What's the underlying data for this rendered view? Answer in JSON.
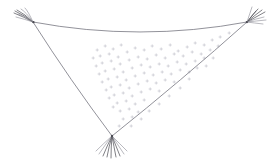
{
  "image": {
    "title": "Triangular net sketch",
    "subject": "triangular-net",
    "background_color": "#ffffff",
    "width": 278,
    "height": 164
  },
  "palette": {
    "line": "#6e6e78",
    "tassel_dark": "#4a4a52",
    "tassel_light": "#8a8a93",
    "speckle": "#b9b9c2",
    "background": "#ffffff"
  },
  "figure": {
    "type": "line-drawing",
    "stroke_style": "thin-pencil",
    "vertices": [
      {
        "name": "left-corner",
        "x": 33,
        "y": 22
      },
      {
        "name": "right-corner",
        "x": 247,
        "y": 22
      },
      {
        "name": "bottom-corner",
        "x": 112,
        "y": 136
      }
    ],
    "edges": [
      {
        "name": "top-edge",
        "from": "left-corner",
        "to": "right-corner",
        "curve": "sagging",
        "path": "M 33 22 Q 140 42 247 22"
      },
      {
        "name": "left-edge",
        "from": "left-corner",
        "to": "bottom-corner",
        "curve": "slightly-bowed",
        "path": "M 33 22 Q 70 80 112 136"
      },
      {
        "name": "right-edge",
        "from": "right-corner",
        "to": "bottom-corner",
        "curve": "slightly-bowed",
        "path": "M 247 22 Q 182 80 112 136"
      }
    ],
    "tassels": [
      {
        "name": "left-tassel",
        "anchor_x": 33,
        "anchor_y": 22,
        "direction": "up-left",
        "strand_count": 7
      },
      {
        "name": "right-tassel",
        "anchor_x": 247,
        "anchor_y": 22,
        "direction": "up-right",
        "strand_count": 8
      },
      {
        "name": "bottom-tassel",
        "anchor_x": 112,
        "anchor_y": 136,
        "direction": "down",
        "strand_count": 9
      }
    ],
    "speckles": {
      "name": "interior-mesh-marks",
      "count": 96,
      "glyph": "small-cross",
      "region": "upper-central interior of triangle",
      "density_note": "densest near the middle-upper area, thinning toward edges and bottom corner"
    }
  }
}
